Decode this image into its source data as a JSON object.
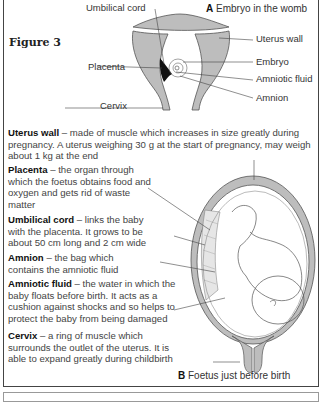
{
  "figure": {
    "title": "Figure 3",
    "diagram_a": {
      "letter": "A",
      "caption": "Embryo in the womb",
      "labels": {
        "umbilical_cord": "Umbilical cord",
        "placenta": "Placenta",
        "cervix": "Cervix",
        "uterus_wall": "Uterus wall",
        "embryo": "Embryo",
        "amniotic_fluid": "Amniotic fluid",
        "amnion": "Amnion"
      }
    },
    "diagram_b": {
      "letter": "B",
      "caption": "Foetus just before birth"
    },
    "descriptions": [
      {
        "term": "Uterus wall",
        "text": " – made of muscle which increases in size greatly during pregnancy. A uterus weighing 30 g at the start of pregnancy, may weigh about 1 kg at the end"
      },
      {
        "term": "Placenta",
        "text": " – the organ through which the foetus obtains food and oxygen and gets rid of waste matter"
      },
      {
        "term": "Umbilical cord",
        "text": " – links the baby with the placenta. It grows to be about 50 cm long and 2 cm wide"
      },
      {
        "term": "Amnion",
        "text": " – the bag which contains the amniotic fluid"
      },
      {
        "term": "Amniotic fluid",
        "text": " – the water in which the baby floats before birth. It acts as a cushion against shocks and so helps to protect the baby from being damaged"
      },
      {
        "term": "Cervix",
        "text": " – a ring of muscle which surrounds the outlet of the uterus. It is able to expand greatly during childbirth"
      }
    ],
    "colors": {
      "tissue_grey": "#bdbdbd",
      "outline": "#555555",
      "placenta_dark": "#111111"
    }
  }
}
